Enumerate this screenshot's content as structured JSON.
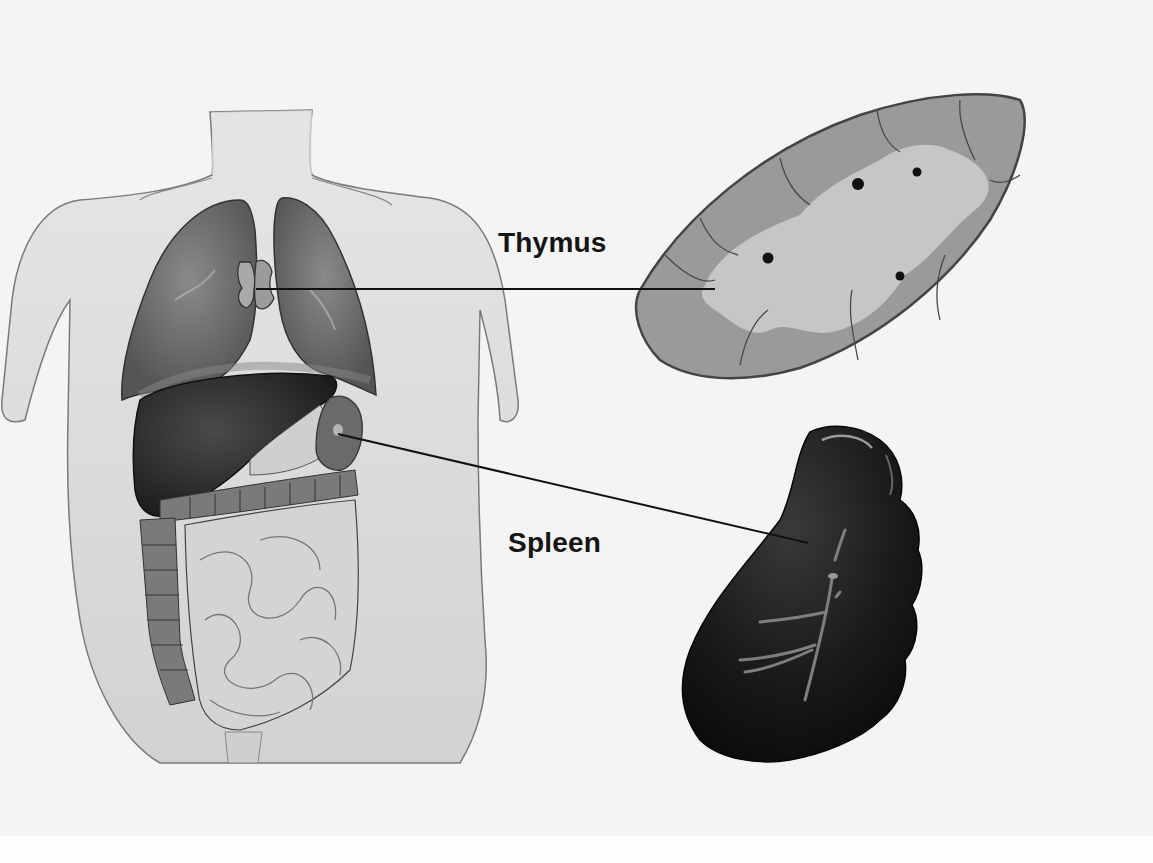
{
  "diagram": {
    "type": "anatomical-illustration",
    "colors": {
      "background": "#f4f4f4",
      "skin": "#dcdcdc",
      "lung": "#6f6f6f",
      "liver": "#2a2a2a",
      "intestine": "#c9c9c9",
      "colon": "#6a6a6a",
      "thymus_cortex": "#8e8e8e",
      "thymus_medulla": "#bdbdbd",
      "spleen": "#151515",
      "leader_line": "#111111",
      "label_text": "#151515"
    },
    "labels": [
      {
        "id": "thymus",
        "text": "Thymus",
        "position": [
          498,
          229
        ],
        "leader_from": [
          256,
          289
        ],
        "leader_to": [
          715,
          289
        ],
        "points_to": "thymus in chest (body figure) and thymus cross-section (upper right)"
      },
      {
        "id": "spleen",
        "text": "Spleen",
        "position": [
          508,
          529
        ],
        "leader_from": [
          338,
          434
        ],
        "leader_to": [
          808,
          543
        ],
        "points_to": "spleen in abdomen (body figure) and enlarged spleen (lower right)"
      }
    ],
    "figures": [
      {
        "id": "torso",
        "description": "Human torso with lungs, thymus, liver, stomach, spleen, small and large intestine exposed"
      },
      {
        "id": "thymus-section",
        "description": "Lobulated cross-section of thymus with dark cortex, pale medulla and four dark corpuscles"
      },
      {
        "id": "spleen-enlarged",
        "description": "Dark glossy spleen with hilar blood vessels"
      }
    ]
  }
}
